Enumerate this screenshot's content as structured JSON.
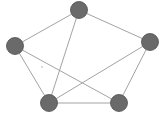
{
  "diagram": {
    "type": "undirected-graph",
    "colors": {
      "node_fill": "#6a6a6a",
      "edge": "#a3a3a3",
      "background": "#ffffff"
    },
    "nodes": [
      {
        "id": "top"
      },
      {
        "id": "left"
      },
      {
        "id": "right"
      },
      {
        "id": "bottom-left"
      },
      {
        "id": "bottom-right"
      }
    ],
    "edges": [
      {
        "from": "top",
        "to": "left"
      },
      {
        "from": "top",
        "to": "right"
      },
      {
        "from": "top",
        "to": "bottom-left"
      },
      {
        "from": "left",
        "to": "bottom-left"
      },
      {
        "from": "left",
        "to": "bottom-right"
      },
      {
        "from": "right",
        "to": "bottom-left"
      },
      {
        "from": "right",
        "to": "bottom-right"
      },
      {
        "from": "bottom-left",
        "to": "bottom-right"
      }
    ]
  }
}
